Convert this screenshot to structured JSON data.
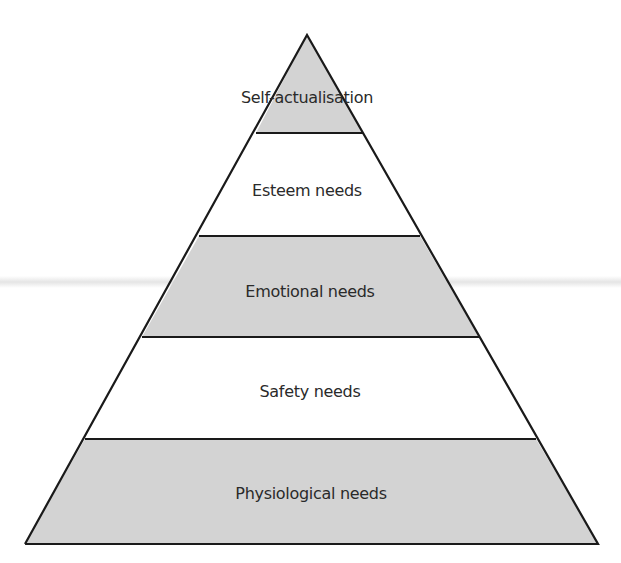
{
  "diagram": {
    "colors": {
      "shaded": "#d3d3d3",
      "unshaded": "#ffffff",
      "outline": "#1a1a1a",
      "text": "#2a2a2a"
    },
    "levels": [
      {
        "label": "Self-actualisation",
        "shaded": true
      },
      {
        "label": "Esteem needs",
        "shaded": false
      },
      {
        "label": "Emotional needs",
        "shaded": true
      },
      {
        "label": "Safety needs",
        "shaded": false
      },
      {
        "label": "Physiological needs",
        "shaded": true
      }
    ]
  }
}
